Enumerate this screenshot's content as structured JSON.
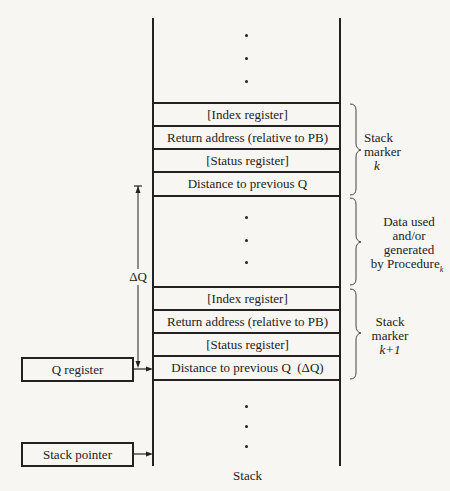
{
  "diagram": {
    "caption": "Stack",
    "marker_k": {
      "rows": [
        "[Index register]",
        "Return address (relative to PB)",
        "[Status register]",
        "Distance to previous Q"
      ],
      "brace_label_line1": "Stack",
      "brace_label_line2": "marker",
      "brace_label_line3": "k"
    },
    "data_section": {
      "brace_label_line1": "Data used",
      "brace_label_line2": "and/or",
      "brace_label_line3": "generated",
      "brace_label_line4": "by Procedure",
      "brace_label_subscript": "k"
    },
    "marker_k1": {
      "rows": [
        "[Index register]",
        "Return address (relative to PB)",
        "[Status register]",
        "Distance to previous Q  (ΔQ)"
      ],
      "brace_label_line1": "Stack",
      "brace_label_line2": "marker",
      "brace_label_line3": "k+1"
    },
    "delta_q_label": "ΔQ",
    "q_register_label": "Q register",
    "stack_pointer_label": "Stack pointer"
  }
}
